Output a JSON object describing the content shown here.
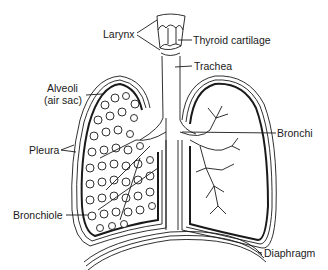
{
  "diagram": {
    "labels": {
      "larynx": "Larynx",
      "thyroid_cartilage": "Thyroid cartilage",
      "trachea": "Trachea",
      "alveoli_line1": "Alveoli",
      "alveoli_line2": "(air sac)",
      "pleura": "Pleura",
      "bronchi": "Bronchi",
      "bronchiole": "Bronchiole",
      "diaphragm": "Diaphragm"
    },
    "colors": {
      "ink": "#1a1a1a",
      "background": "#ffffff"
    }
  }
}
